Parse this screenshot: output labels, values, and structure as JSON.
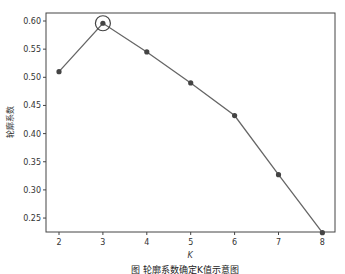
{
  "chart_data": {
    "type": "line",
    "title": "",
    "xlabel": "K",
    "ylabel": "轮廓系数",
    "x": [
      2,
      3,
      4,
      5,
      6,
      7,
      8
    ],
    "values": [
      0.51,
      0.596,
      0.545,
      0.49,
      0.432,
      0.327,
      0.224
    ],
    "xticks": [
      "2",
      "3",
      "4",
      "5",
      "6",
      "7",
      "8"
    ],
    "yticks": [
      "0.25",
      "0.30",
      "0.35",
      "0.40",
      "0.45",
      "0.50",
      "0.55",
      "0.60"
    ],
    "xlim": [
      1.7,
      8.3
    ],
    "ylim": [
      0.21,
      0.615
    ],
    "grid": false,
    "legend": null,
    "annotations": [
      {
        "type": "circle-highlight",
        "x": 3,
        "y": 0.596,
        "meaning": "optimal K"
      }
    ],
    "caption": "图 轮廓系数确定K值示意图"
  },
  "colors": {
    "line": "#666666",
    "marker": "#444444",
    "frame": "#444444",
    "highlight": "#444444"
  }
}
